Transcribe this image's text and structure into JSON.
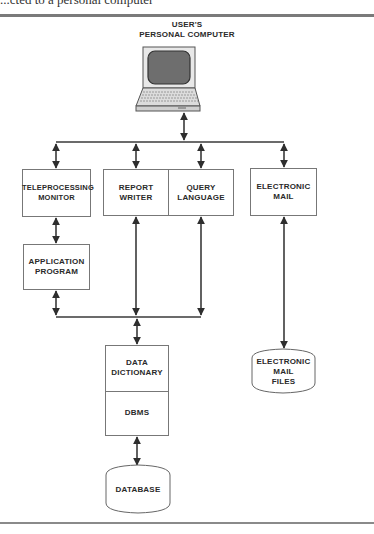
{
  "page": {
    "top_text_fragment": "...cted to a personal computer"
  },
  "diagram": {
    "title_line1": "USER'S",
    "title_line2": "PERSONAL COMPUTER",
    "nodes": {
      "teleprocessing_monitor": {
        "line1": "TELEPROCESSING",
        "line2": "MONITOR"
      },
      "report_writer": {
        "line1": "REPORT",
        "line2": "WRITER"
      },
      "query_language": {
        "line1": "QUERY",
        "line2": "LANGUAGE"
      },
      "electronic_mail": {
        "line1": "ELECTRONIC",
        "line2": "MAIL"
      },
      "application_program": {
        "line1": "APPLICATION",
        "line2": "PROGRAM"
      },
      "data_dictionary": {
        "line1": "DATA",
        "line2": "DICTIONARY"
      },
      "dbms": {
        "line1": "DBMS"
      },
      "electronic_mail_files": {
        "line1": "ELECTRONIC",
        "line2": "MAIL",
        "line3": "FILES"
      },
      "database": {
        "line1": "DATABASE"
      }
    },
    "connections": [
      {
        "from": "USER'S PERSONAL COMPUTER",
        "to": "upper bus",
        "type": "bidirectional"
      },
      {
        "from": "upper bus",
        "to": "TELEPROCESSING MONITOR",
        "type": "bidirectional"
      },
      {
        "from": "upper bus",
        "to": "REPORT WRITER",
        "type": "bidirectional"
      },
      {
        "from": "upper bus",
        "to": "QUERY LANGUAGE",
        "type": "bidirectional"
      },
      {
        "from": "upper bus",
        "to": "ELECTRONIC MAIL",
        "type": "bidirectional"
      },
      {
        "from": "TELEPROCESSING MONITOR",
        "to": "APPLICATION PROGRAM",
        "type": "bidirectional"
      },
      {
        "from": "APPLICATION PROGRAM",
        "to": "lower bus",
        "type": "bidirectional"
      },
      {
        "from": "REPORT WRITER",
        "to": "lower bus",
        "type": "bidirectional"
      },
      {
        "from": "QUERY LANGUAGE",
        "to": "lower bus",
        "type": "bidirectional"
      },
      {
        "from": "lower bus",
        "to": "DATA DICTIONARY",
        "type": "bidirectional"
      },
      {
        "from": "DBMS",
        "to": "DATABASE",
        "type": "bidirectional"
      },
      {
        "from": "ELECTRONIC MAIL",
        "to": "ELECTRONIC MAIL FILES",
        "type": "bidirectional"
      }
    ],
    "colors": {
      "line": "#3a3a3a",
      "box_border": "#777777",
      "rule": "#7a7a7a",
      "screen": "#6e6e6e"
    }
  }
}
